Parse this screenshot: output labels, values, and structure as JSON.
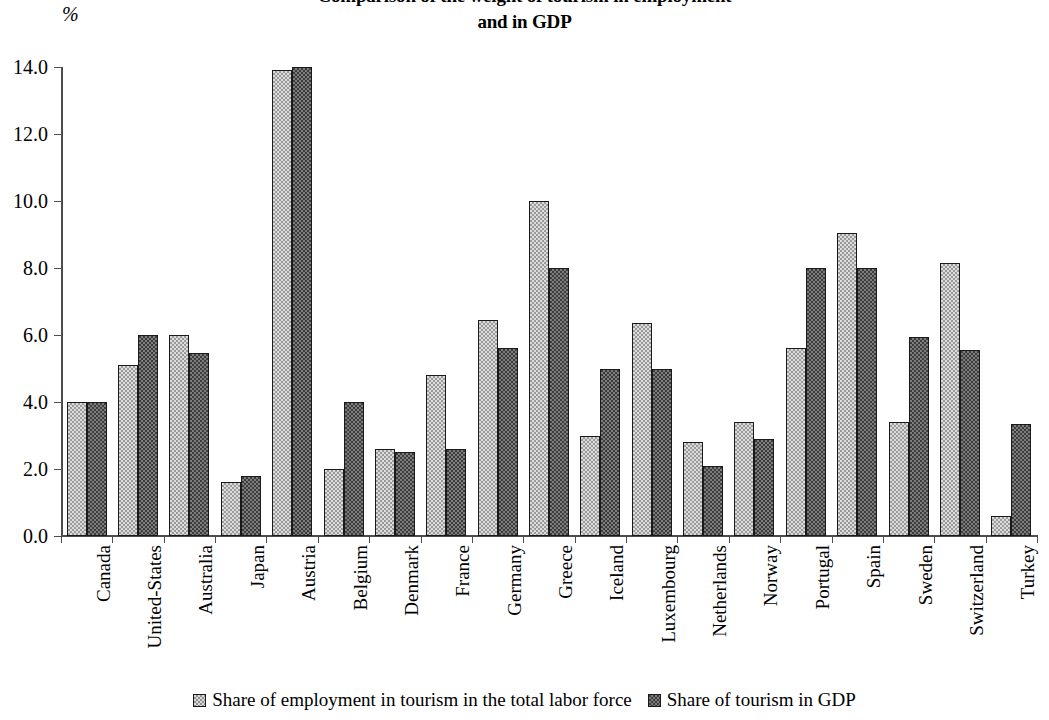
{
  "axis_unit_label": "%",
  "title": {
    "line1": "Comparison of the weight of tourism in employment",
    "line2": "and in GDP"
  },
  "legend": {
    "position": "bottom-center",
    "entries": [
      {
        "label": "Share of employment in tourism in the total labor force",
        "swatch": "light-checker",
        "color": "#dcdcdc"
      },
      {
        "label": "Share of tourism in GDP",
        "swatch": "dark-checker",
        "color": "#3c3c3c"
      }
    ]
  },
  "chart_data": {
    "type": "bar",
    "title": "Comparison of the weight of tourism in employment and in GDP",
    "xlabel": "",
    "ylabel": "%",
    "ylim": [
      0.0,
      14.0
    ],
    "ytick_labels": [
      "0.0",
      "2.0",
      "4.0",
      "6.0",
      "8.0",
      "10.0",
      "12.0",
      "14.0"
    ],
    "ytick_values": [
      0.0,
      2.0,
      4.0,
      6.0,
      8.0,
      10.0,
      12.0,
      14.0
    ],
    "grid": false,
    "categories": [
      "Canada",
      "United-States",
      "Australia",
      "Japan",
      "Austria",
      "Belgium",
      "Denmark",
      "France",
      "Germany",
      "Greece",
      "Iceland",
      "Luxembourg",
      "Netherlands",
      "Norway",
      "Portugal",
      "Spain",
      "Sweden",
      "Switzerland",
      "Turkey"
    ],
    "series": [
      {
        "name": "Share of employment in tourism in the total labor force",
        "color": "#dcdcdc",
        "values": [
          4.0,
          5.1,
          6.0,
          1.6,
          13.9,
          2.0,
          2.6,
          4.8,
          6.45,
          10.0,
          3.0,
          6.35,
          2.8,
          3.4,
          5.6,
          9.05,
          3.4,
          8.15,
          0.6
        ]
      },
      {
        "name": "Share of tourism in GDP",
        "color": "#3c3c3c",
        "values": [
          4.0,
          6.0,
          5.45,
          1.8,
          14.0,
          4.0,
          2.5,
          2.6,
          5.6,
          8.0,
          5.0,
          5.0,
          2.1,
          2.9,
          8.0,
          8.0,
          5.95,
          5.55,
          3.35
        ]
      }
    ]
  }
}
